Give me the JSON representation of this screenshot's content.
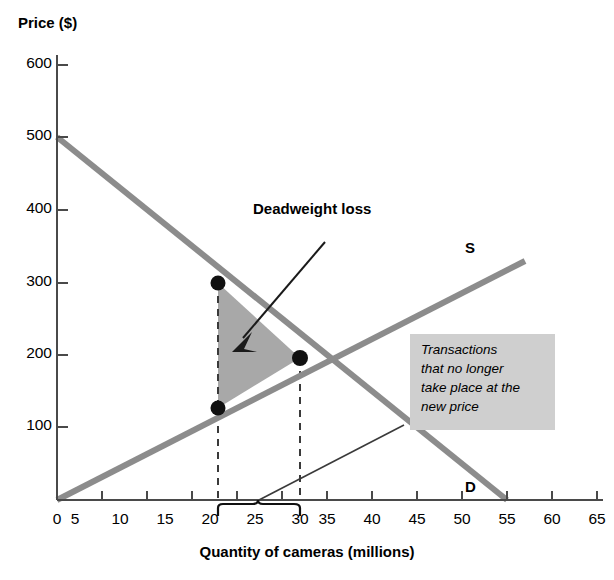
{
  "chart_data": {
    "type": "line",
    "title": "",
    "xlabel": "Quantity of cameras (millions)",
    "ylabel": "Price ($)",
    "xlim": [
      0,
      67
    ],
    "ylim": [
      0,
      640
    ],
    "xticks": [
      0,
      5,
      10,
      15,
      20,
      25,
      30,
      35,
      40,
      45,
      50,
      55,
      60,
      65
    ],
    "yticks": [
      100,
      200,
      300,
      400,
      500,
      600
    ],
    "grid": false,
    "legend": "inline-curve-labels",
    "series": [
      {
        "name": "Supply",
        "label": "S",
        "type": "line",
        "color": "#8c8c8c",
        "points": [
          [
            0,
            0
          ],
          [
            52,
            330
          ]
        ]
      },
      {
        "name": "Demand",
        "label": "D",
        "type": "line",
        "color": "#8c8c8c",
        "points": [
          [
            0,
            500
          ],
          [
            50,
            0
          ]
        ]
      }
    ],
    "points": [
      {
        "name": "demand-point-at-q20",
        "x": 20,
        "y": 300
      },
      {
        "name": "supply-point-at-q20",
        "x": 20,
        "y": 135
      },
      {
        "name": "equilibrium-point",
        "x": 30,
        "y": 197
      }
    ],
    "shaded_region": {
      "name": "Deadweight loss",
      "fill": "#a8a8a8",
      "vertices": [
        [
          20,
          300
        ],
        [
          20,
          135
        ],
        [
          30,
          197
        ]
      ]
    },
    "dashed_lines": [
      {
        "x": 20,
        "from_y": 300,
        "to_y": 0
      },
      {
        "x": 30,
        "from_y": 197,
        "to_y": 0
      }
    ],
    "brace": {
      "from_x": 20,
      "to_x": 30,
      "center_x": 25
    }
  },
  "axes": {
    "y_title": "Price ($)",
    "x_title": "Quantity of cameras (millions)",
    "y_tick_labels": [
      "600",
      "500",
      "400",
      "300",
      "200",
      "100"
    ],
    "x_tick_labels": [
      "0",
      "5",
      "10",
      "15",
      "20",
      "25",
      "30",
      "35",
      "40",
      "45",
      "50",
      "55",
      "60",
      "65"
    ]
  },
  "annotations": {
    "deadweight_loss_label": "Deadweight loss",
    "supply_curve_label": "S",
    "demand_curve_label": "D",
    "callout": {
      "line1": "Transactions",
      "line2": "that no longer",
      "line3": "take place at the",
      "line4": "new price",
      "background": "#cfcfcf"
    }
  },
  "colors": {
    "curve": "#8c8c8c",
    "shaded_region": "#a8a8a8",
    "axis": "#3a3a3a",
    "text": "#000000",
    "callout_bg": "#cfcfcf"
  }
}
